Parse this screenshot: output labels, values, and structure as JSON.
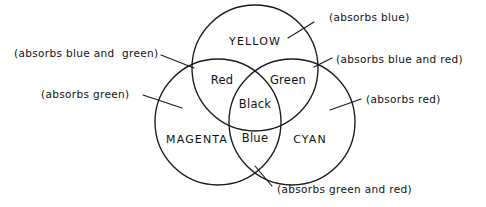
{
  "figure": {
    "type": "venn-diagram",
    "background_color": "#ffffff",
    "line_color": "#1a1a1a"
  },
  "circles": [
    {
      "id": "yellow",
      "label": "YELLOW",
      "label_x": 255,
      "label_y": 35,
      "cx": 255,
      "cy": 68,
      "r": 63
    },
    {
      "id": "magenta",
      "label": "MAGENTA",
      "label_x": 197,
      "label_y": 133,
      "cx": 218,
      "cy": 122,
      "r": 63
    },
    {
      "id": "cyan",
      "label": "CYAN",
      "label_x": 310,
      "label_y": 133,
      "cx": 292,
      "cy": 122,
      "r": 63
    }
  ],
  "regions": [
    {
      "id": "red",
      "label": "Red",
      "x": 222,
      "y": 73
    },
    {
      "id": "green",
      "label": "Green",
      "x": 288,
      "y": 73
    },
    {
      "id": "black",
      "label": "Black",
      "x": 255,
      "y": 97
    },
    {
      "id": "blue",
      "label": "Blue",
      "x": 255,
      "y": 131
    }
  ],
  "callouts": [
    {
      "id": "absorbs-blue",
      "text": "(absorbs blue)",
      "text_x": 329,
      "text_y": 11,
      "align": "left",
      "leader": {
        "x1": 314,
        "y1": 22,
        "x2": 288,
        "y2": 38
      }
    },
    {
      "id": "absorbs-blue-and-green",
      "text": "(absorbs blue and  green)",
      "text_x": 14,
      "text_y": 47,
      "align": "left",
      "leader": {
        "x1": 161,
        "y1": 55,
        "x2": 194,
        "y2": 68
      }
    },
    {
      "id": "absorbs-blue-and-red",
      "text": "(absorbs blue and red)",
      "text_x": 336,
      "text_y": 53,
      "align": "left",
      "leader": {
        "x1": 332,
        "y1": 58,
        "x2": 314,
        "y2": 67
      }
    },
    {
      "id": "absorbs-green",
      "text": "(absorbs green)",
      "text_x": 41,
      "text_y": 88,
      "align": "left",
      "leader": {
        "x1": 143,
        "y1": 95,
        "x2": 182,
        "y2": 108
      }
    },
    {
      "id": "absorbs-red",
      "text": "(absorbs red)",
      "text_x": 366,
      "text_y": 93,
      "align": "left",
      "leader": {
        "x1": 361,
        "y1": 99,
        "x2": 330,
        "y2": 110
      }
    },
    {
      "id": "absorbs-green-and-red",
      "text": "(absorbs green and red)",
      "text_x": 277,
      "text_y": 183,
      "align": "left",
      "leader": {
        "x1": 272,
        "y1": 186,
        "x2": 255,
        "y2": 166
      }
    }
  ]
}
